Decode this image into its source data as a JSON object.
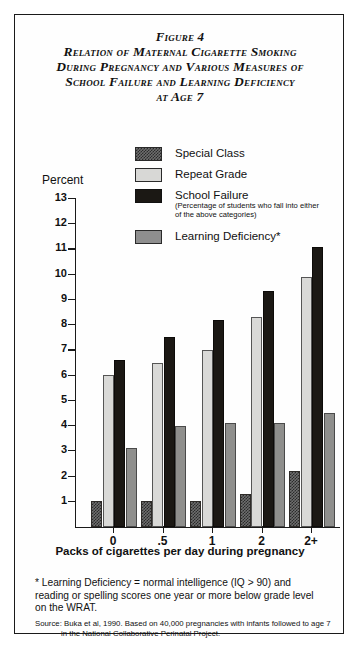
{
  "figure": {
    "title_lines": [
      "Figure 4",
      "Relation of Maternal Cigarette Smoking",
      "During Pregnancy and Various Measures of",
      "School Failure and Learning Deficiency",
      "at Age 7"
    ],
    "percent_label": "Percent",
    "footnote": "* Learning Deficiency = normal intelligence (IQ > 90) and reading or spelling scores one year or more below grade level on the WRAT.",
    "source_line1": "Source: Buka et al, 1990. Based on 40,000 pregnancies with infants followed to age 7",
    "source_line2": "in the National Collaborative Perinatal Project."
  },
  "legend": {
    "items": [
      {
        "label": "Special Class",
        "swatch": "checkered-dark-swatch",
        "sub": ""
      },
      {
        "label": "Repeat Grade",
        "swatch": "light-gray-swatch",
        "sub": ""
      },
      {
        "label": "School Failure",
        "swatch": "black-swatch",
        "sub": "(Percentage of students who fall into either of the above categories)"
      },
      {
        "label": "Learning Deficiency*",
        "swatch": "medium-gray-swatch",
        "sub": ""
      }
    ]
  },
  "chart_data": {
    "type": "bar",
    "title": "Relation of Maternal Cigarette Smoking During Pregnancy and Various Measures of School Failure and Learning Deficiency at Age 7",
    "xlabel": "Packs of cigarettes per day during pregnancy",
    "ylabel": "Percent",
    "categories": [
      "0",
      ".5",
      "1",
      "2",
      "2+"
    ],
    "ylim": [
      0,
      13
    ],
    "yticks": [
      0,
      1,
      2,
      3,
      4,
      5,
      6,
      7,
      8,
      9,
      10,
      11,
      12,
      13
    ],
    "ytick_labels": [
      "0",
      "1",
      "2",
      "3",
      "4",
      "5",
      "6",
      "7",
      "8",
      "9",
      "10",
      "11",
      "12",
      "13"
    ],
    "grid": false,
    "legend_position": "top-right",
    "series": [
      {
        "name": "Special Class",
        "color": "#6e6e6e",
        "values": [
          1.0,
          1.0,
          1.0,
          1.3,
          2.2
        ]
      },
      {
        "name": "Repeat Grade",
        "color": "#d9d9d7",
        "values": [
          6.0,
          6.5,
          7.0,
          8.3,
          9.9
        ]
      },
      {
        "name": "School Failure",
        "color": "#1b1814",
        "values": [
          6.6,
          7.5,
          8.2,
          9.35,
          11.1
        ]
      },
      {
        "name": "Learning Deficiency",
        "color": "#8f8f8d",
        "values": [
          3.1,
          4.0,
          4.1,
          4.1,
          4.5
        ]
      }
    ]
  }
}
